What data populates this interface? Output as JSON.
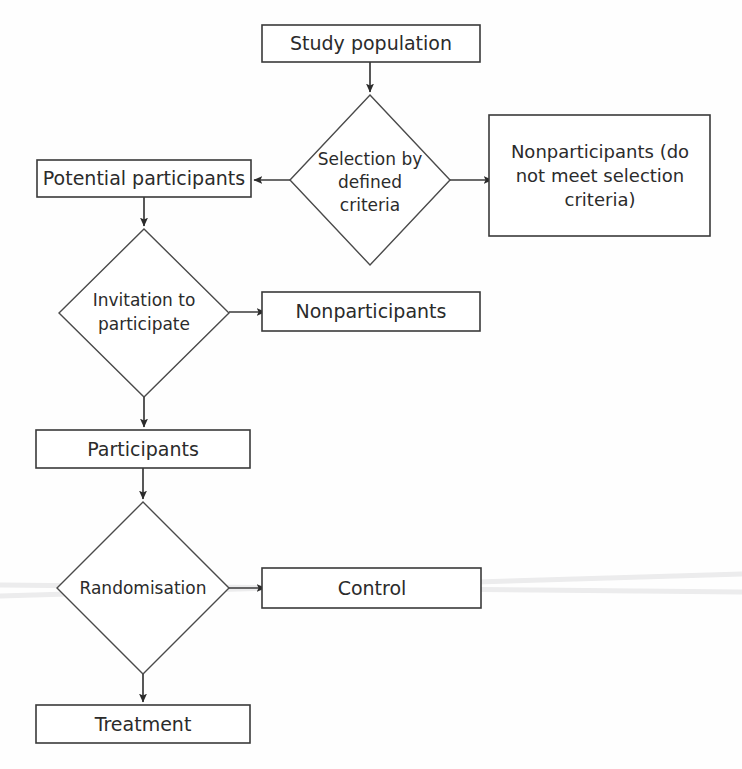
{
  "diagram": {
    "background_color": "#fefefe",
    "line_color": "#3a3a3a",
    "text_color": "#2b2b2b",
    "nodes": [
      {
        "id": "study-population",
        "shape": "box",
        "label": "Study population",
        "lines": [
          "Study population"
        ],
        "x": 262,
        "y": 25,
        "w": 218,
        "h": 37,
        "font_size": 19
      },
      {
        "id": "selection-criteria",
        "shape": "diamond",
        "label": "Selection by defined criteria",
        "lines": [
          "Selection by",
          "defined",
          "criteria"
        ],
        "cx": 370,
        "cy": 180,
        "rx": 80,
        "ry": 85,
        "font_size": 17
      },
      {
        "id": "potential-participants",
        "shape": "box",
        "label": "Potential participants",
        "lines": [
          "Potential participants"
        ],
        "x": 37,
        "y": 160,
        "w": 214,
        "h": 37,
        "font_size": 19
      },
      {
        "id": "nonparticipants-criteria",
        "shape": "box",
        "label": "Nonparticipants (do not meet selection criteria)",
        "lines": [
          "Nonparticipants (do",
          "not meet selection",
          "criteria)"
        ],
        "x": 489,
        "y": 115,
        "w": 221,
        "h": 121,
        "font_size": 18
      },
      {
        "id": "invitation-participate",
        "shape": "diamond",
        "label": "Invitation to participate",
        "lines": [
          "Invitation to",
          "participate"
        ],
        "cx": 144,
        "cy": 313,
        "rx": 85,
        "ry": 84,
        "font_size": 17
      },
      {
        "id": "nonparticipants",
        "shape": "box",
        "label": "Nonparticipants",
        "lines": [
          "Nonparticipants"
        ],
        "x": 262,
        "y": 292,
        "w": 218,
        "h": 39,
        "font_size": 19
      },
      {
        "id": "participants",
        "shape": "box",
        "label": "Participants",
        "lines": [
          "Participants"
        ],
        "x": 36,
        "y": 430,
        "w": 214,
        "h": 38,
        "font_size": 19
      },
      {
        "id": "randomisation",
        "shape": "diamond",
        "label": "Randomisation",
        "lines": [
          "Randomisation"
        ],
        "cx": 143,
        "cy": 588,
        "rx": 86,
        "ry": 86,
        "font_size": 17
      },
      {
        "id": "control",
        "shape": "box",
        "label": "Control",
        "lines": [
          "Control"
        ],
        "x": 262,
        "y": 568,
        "w": 219,
        "h": 40,
        "font_size": 19
      },
      {
        "id": "treatment",
        "shape": "box",
        "label": "Treatment",
        "lines": [
          "Treatment"
        ],
        "x": 36,
        "y": 705,
        "w": 214,
        "h": 38,
        "font_size": 19
      }
    ],
    "edges": [
      {
        "id": "edge-study-to-selection",
        "from": "study-population",
        "to": "selection-criteria",
        "direction": "down",
        "arrow": true
      },
      {
        "id": "edge-selection-to-potential",
        "from": "selection-criteria",
        "to": "potential-participants",
        "direction": "left",
        "arrow": true
      },
      {
        "id": "edge-selection-to-nonparticipants-criteria",
        "from": "selection-criteria",
        "to": "nonparticipants-criteria",
        "direction": "right",
        "arrow": true
      },
      {
        "id": "edge-potential-to-invitation",
        "from": "potential-participants",
        "to": "invitation-participate",
        "direction": "down",
        "arrow": true
      },
      {
        "id": "edge-invitation-to-nonparticipants",
        "from": "invitation-participate",
        "to": "nonparticipants",
        "direction": "right",
        "arrow": true
      },
      {
        "id": "edge-invitation-to-participants",
        "from": "invitation-participate",
        "to": "participants",
        "direction": "down",
        "arrow": true
      },
      {
        "id": "edge-participants-to-randomisation",
        "from": "participants",
        "to": "randomisation",
        "direction": "down",
        "arrow": true
      },
      {
        "id": "edge-randomisation-to-control",
        "from": "randomisation",
        "to": "control",
        "direction": "right",
        "arrow": true
      },
      {
        "id": "edge-randomisation-to-treatment",
        "from": "randomisation",
        "to": "treatment",
        "direction": "down",
        "arrow": true
      }
    ]
  }
}
